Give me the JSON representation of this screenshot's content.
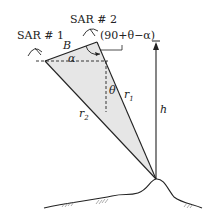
{
  "diagram": {
    "type": "SAR interferometry geometry",
    "labels": {
      "sar1": "SAR # 1",
      "sar2": "SAR # 2",
      "baseline": "B",
      "alpha": "α",
      "angle_expr": "(90+θ−α)",
      "theta": "θ",
      "r1_base": "r",
      "r1_sub": "1",
      "r2_base": "r",
      "r2_sub": "2",
      "height": "h"
    },
    "colors": {
      "line": "#222222",
      "fill": "#e6e6e6",
      "background": "#ffffff"
    }
  }
}
